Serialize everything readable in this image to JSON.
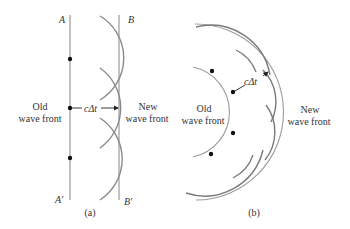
{
  "figure": {
    "panel_a": {
      "caption": "(a)",
      "labels": {
        "A": "A",
        "B": "B",
        "A_prime": "A′",
        "B_prime": "B′"
      },
      "old_front": {
        "line1": "Old",
        "line2": "wave front"
      },
      "new_front": {
        "line1": "New",
        "line2": "wave front"
      },
      "distance_label": "cΔt"
    },
    "panel_b": {
      "caption": "(b)",
      "old_front": {
        "line1": "Old",
        "line2": "wave front"
      },
      "new_front": {
        "line1": "New",
        "line2": "wave front"
      },
      "distance_label": "cΔt"
    },
    "colors": {
      "line": "#9a9a9a",
      "dot": "#111111",
      "text": "#333333"
    }
  }
}
